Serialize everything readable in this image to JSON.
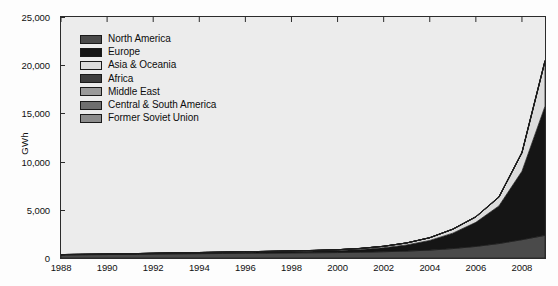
{
  "chart_data": {
    "type": "area",
    "stacked": true,
    "title": "",
    "xlabel": "",
    "ylabel": "GWh",
    "xlim": [
      1988,
      2009
    ],
    "ylim": [
      0,
      25000
    ],
    "grid": false,
    "legend_position": "top-left",
    "x": [
      1988,
      1989,
      1990,
      1991,
      1992,
      1993,
      1994,
      1995,
      1996,
      1997,
      1998,
      1999,
      2000,
      2001,
      2002,
      2003,
      2004,
      2005,
      2006,
      2007,
      2008,
      2009
    ],
    "y_ticks": [
      0,
      5000,
      10000,
      15000,
      20000,
      25000
    ],
    "y_tick_labels": [
      "0",
      "5,000",
      "10,000",
      "15,000",
      "20,000",
      "25,000"
    ],
    "x_ticks": [
      1988,
      1990,
      1992,
      1994,
      1996,
      1998,
      2000,
      2002,
      2004,
      2006,
      2008
    ],
    "x_tick_labels": [
      "1988",
      "1990",
      "1992",
      "1994",
      "1996",
      "1998",
      "2000",
      "2002",
      "2004",
      "2006",
      "2008"
    ],
    "series": [
      {
        "name": "North America",
        "color": "#4a4a4a",
        "values": [
          320,
          340,
          360,
          385,
          410,
          430,
          450,
          470,
          490,
          510,
          530,
          545,
          565,
          600,
          650,
          720,
          820,
          980,
          1200,
          1500,
          1900,
          2350
        ]
      },
      {
        "name": "Europe",
        "color": "#151515",
        "values": [
          20,
          25,
          30,
          40,
          55,
          70,
          85,
          100,
          115,
          130,
          150,
          175,
          215,
          290,
          420,
          640,
          1000,
          1600,
          2500,
          3900,
          7100,
          13400
        ]
      },
      {
        "name": "Asia & Oceania",
        "color": "#dcdcdc",
        "values": [
          18,
          20,
          22,
          25,
          28,
          32,
          36,
          40,
          45,
          50,
          58,
          66,
          80,
          105,
          145,
          200,
          280,
          400,
          560,
          900,
          1900,
          4650
        ]
      },
      {
        "name": "Africa",
        "color": "#3e3e3e",
        "values": [
          0,
          0,
          0,
          0,
          0,
          0,
          0,
          0,
          0,
          0,
          0,
          0,
          0,
          0,
          0,
          0,
          1,
          2,
          3,
          5,
          8,
          12
        ]
      },
      {
        "name": "Middle East",
        "color": "#9a9a9a",
        "values": [
          0,
          0,
          0,
          0,
          0,
          0,
          0,
          0,
          0,
          0,
          0,
          0,
          0,
          0,
          0,
          0,
          0,
          1,
          1,
          2,
          4,
          8
        ]
      },
      {
        "name": "Central & South America",
        "color": "#6e6e6e",
        "values": [
          0,
          0,
          0,
          0,
          0,
          0,
          0,
          0,
          1,
          1,
          2,
          2,
          3,
          4,
          6,
          9,
          14,
          20,
          28,
          40,
          55,
          75
        ]
      },
      {
        "name": "Former Soviet Union",
        "color": "#8c8c8c",
        "values": [
          0,
          0,
          0,
          0,
          0,
          0,
          0,
          0,
          0,
          0,
          0,
          0,
          0,
          0,
          0,
          0,
          0,
          0,
          1,
          1,
          2,
          3
        ]
      }
    ],
    "totals": [
      358,
      385,
      412,
      450,
      493,
      532,
      571,
      610,
      651,
      691,
      740,
      788,
      863,
      999,
      1221,
      1569,
      2115,
      3003,
      4293,
      6348,
      10969,
      20498
    ]
  },
  "legend": {
    "items": [
      {
        "label": "North America",
        "color": "#4a4a4a"
      },
      {
        "label": "Europe",
        "color": "#151515"
      },
      {
        "label": "Asia & Oceania",
        "color": "#dcdcdc"
      },
      {
        "label": "Africa",
        "color": "#3e3e3e"
      },
      {
        "label": "Middle East",
        "color": "#9a9a9a"
      },
      {
        "label": "Central & South America",
        "color": "#6e6e6e"
      },
      {
        "label": "Former Soviet Union",
        "color": "#8c8c8c"
      }
    ]
  },
  "axes": {
    "y_title": "GWh"
  },
  "style": {
    "plot_background": "#ececec",
    "frame_color": "#2b2b2b",
    "page_background": "#fdfdfd"
  }
}
